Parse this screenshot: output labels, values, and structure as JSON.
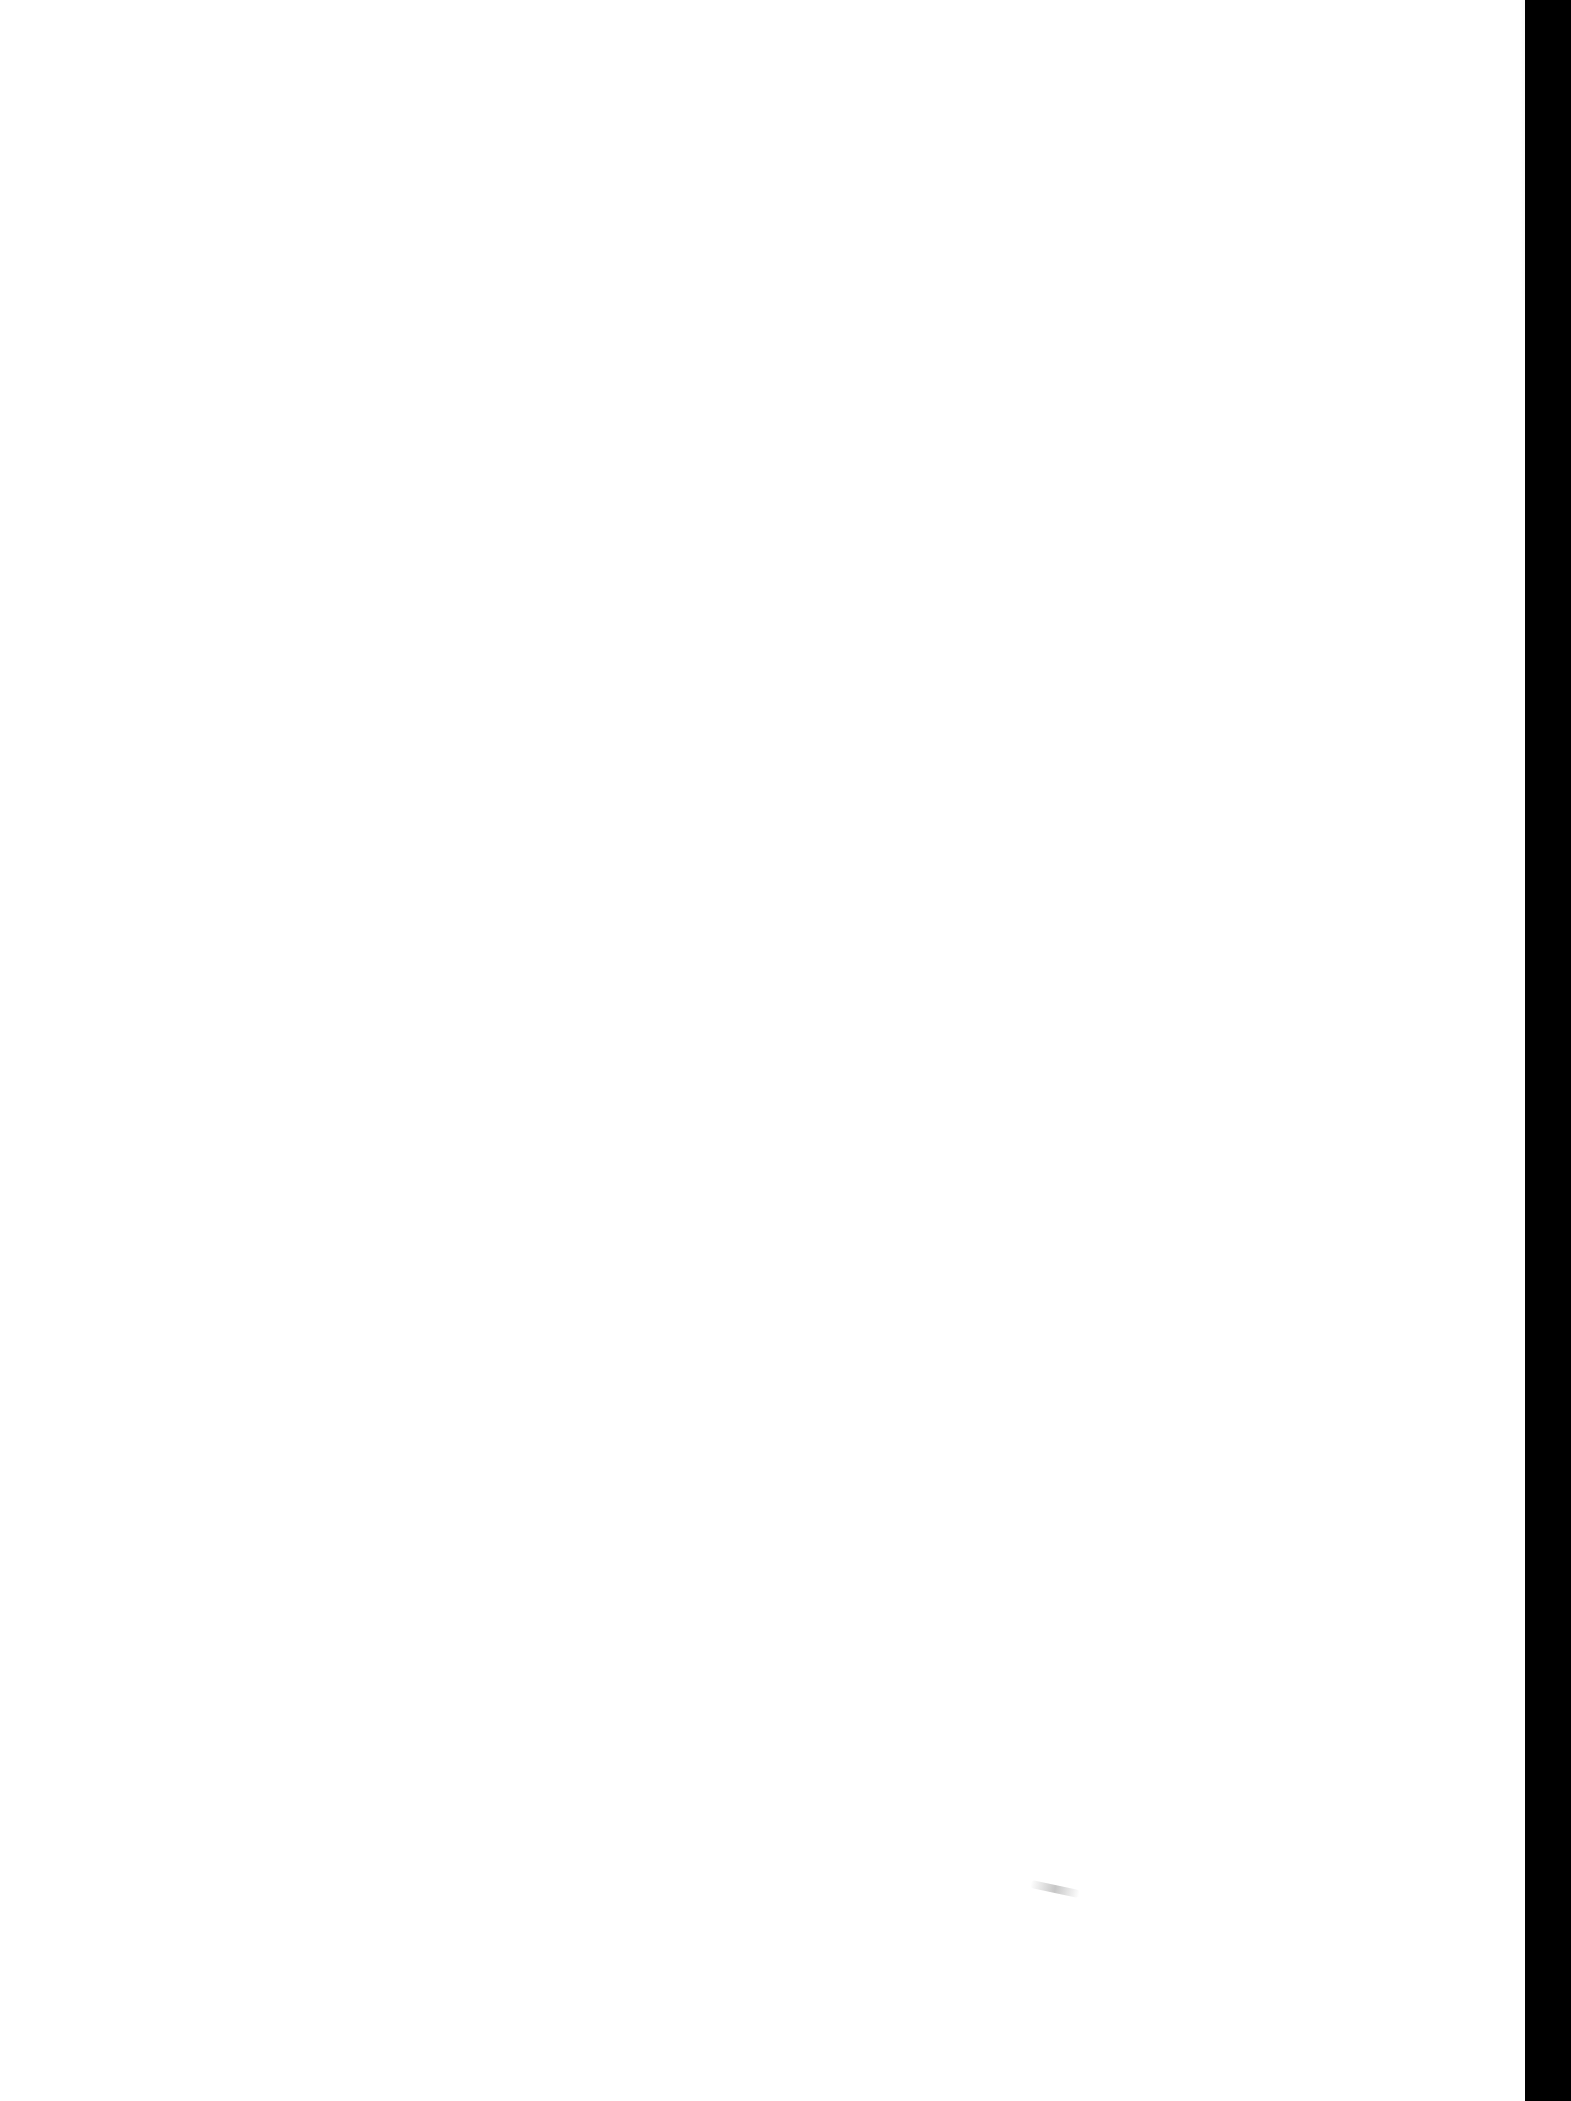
{
  "document": {
    "type": "scanned-blank-page",
    "text_content": "",
    "colors": {
      "paper": "#ffffff",
      "scan_edge": "#000000",
      "smudge": "#a0a0a0"
    }
  }
}
